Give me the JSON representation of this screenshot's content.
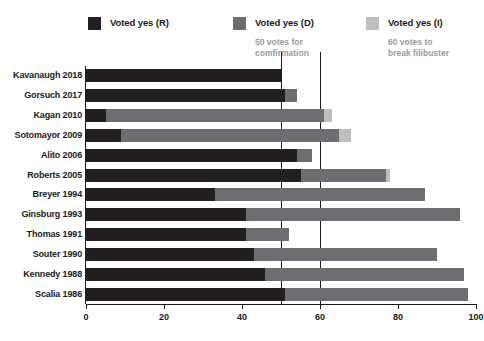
{
  "legend": {
    "items": [
      {
        "label": "Voted yes (R)",
        "color": "#231f20",
        "key": "r"
      },
      {
        "label": "Voted yes (D)",
        "color": "#6d6e71",
        "key": "d"
      },
      {
        "label": "Voted yes (I)",
        "color": "#bcbec0",
        "key": "i"
      }
    ],
    "notes": [
      {
        "line1": "50 votes for",
        "line2": "comfirmation",
        "at": 50
      },
      {
        "line1": "60 votes to",
        "line2": "break filibuster",
        "at": 60
      }
    ]
  },
  "chart_data": {
    "type": "bar",
    "orientation": "horizontal",
    "stacked": true,
    "title": "",
    "xlabel": "",
    "ylabel": "",
    "xlim": [
      0,
      100
    ],
    "xticks": [
      0,
      20,
      40,
      60,
      80,
      100
    ],
    "xtick_labels": [
      "0",
      "20",
      "40",
      "60",
      "80",
      "100"
    ],
    "grid": false,
    "legend_position": "top",
    "reference_lines": [
      {
        "value": 50,
        "label": "50 votes for comfirmation"
      },
      {
        "value": 60,
        "label": "60 votes to break filibuster"
      }
    ],
    "categories": [
      "Kavanaugh 2018",
      "Gorsuch 2017",
      "Kagan 2010",
      "Sotomayor 2009",
      "Alito 2006",
      "Roberts 2005",
      "Breyer 1994",
      "Ginsburg 1993",
      "Thomas 1991",
      "Souter 1990",
      "Kennedy 1988",
      "Scalia 1986"
    ],
    "series": [
      {
        "name": "Voted yes (R)",
        "color": "#231f20",
        "values": [
          50,
          51,
          5,
          9,
          54,
          55,
          33,
          41,
          41,
          43,
          46,
          51
        ]
      },
      {
        "name": "Voted yes (D)",
        "color": "#6d6e71",
        "values": [
          0,
          3,
          56,
          56,
          4,
          22,
          54,
          55,
          11,
          47,
          51,
          47
        ]
      },
      {
        "name": "Voted yes (I)",
        "color": "#bcbec0",
        "values": [
          0,
          0,
          2,
          3,
          0,
          1,
          0,
          0,
          0,
          0,
          0,
          0
        ]
      }
    ],
    "totals": [
      50,
      54,
      63,
      68,
      58,
      78,
      87,
      96,
      52,
      90,
      97,
      98
    ]
  },
  "colors": {
    "r": "#231f20",
    "d": "#6d6e71",
    "i": "#bcbec0",
    "axis": "#1a1a1a",
    "note": "#9a9a9a",
    "background": "#ffffff"
  }
}
